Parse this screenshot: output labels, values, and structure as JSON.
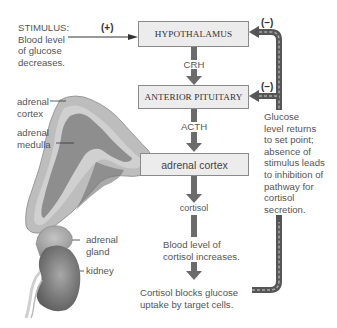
{
  "stimulus": {
    "lines": [
      "STIMULUS:",
      "Blood level",
      "of glucose",
      "decreases."
    ],
    "sign": "(+)"
  },
  "boxes": {
    "hypothalamus": "HYPOTHALAMUS",
    "anterior_pituitary": "ANTERIOR PITUITARY",
    "adrenal_cortex": "adrenal cortex"
  },
  "hormones": {
    "crh": "CRH",
    "acth": "ACTH",
    "cortisol": "cortisol"
  },
  "outcomes": {
    "blood_level": [
      "Blood level of",
      "cortisol increases."
    ],
    "blocks": [
      "Cortisol blocks glucose",
      "uptake by target cells."
    ]
  },
  "feedback": {
    "sign_hypothalamus": "(–)",
    "sign_pituitary": "(–)",
    "note": [
      "Glucose",
      "level returns",
      "to set point;",
      "absence of",
      "stimulus leads",
      "to inhibition of",
      "pathway for",
      "cortisol",
      "secretion."
    ]
  },
  "anatomy_labels": {
    "adrenal_cortex": [
      "adrenal",
      "cortex"
    ],
    "adrenal_medulla": [
      "adrenal",
      "medulla"
    ],
    "adrenal_gland": [
      "adrenal",
      "gland"
    ],
    "kidney": "kidney"
  },
  "colors": {
    "arrow": "#6b6b6b",
    "box_fill": "#ececec",
    "box_border": "#8a8a8a",
    "feedback_dash": "#9a9a9a",
    "cortex_tissue": "#b8b8b8",
    "medulla_tissue": "#8e8e8e"
  }
}
